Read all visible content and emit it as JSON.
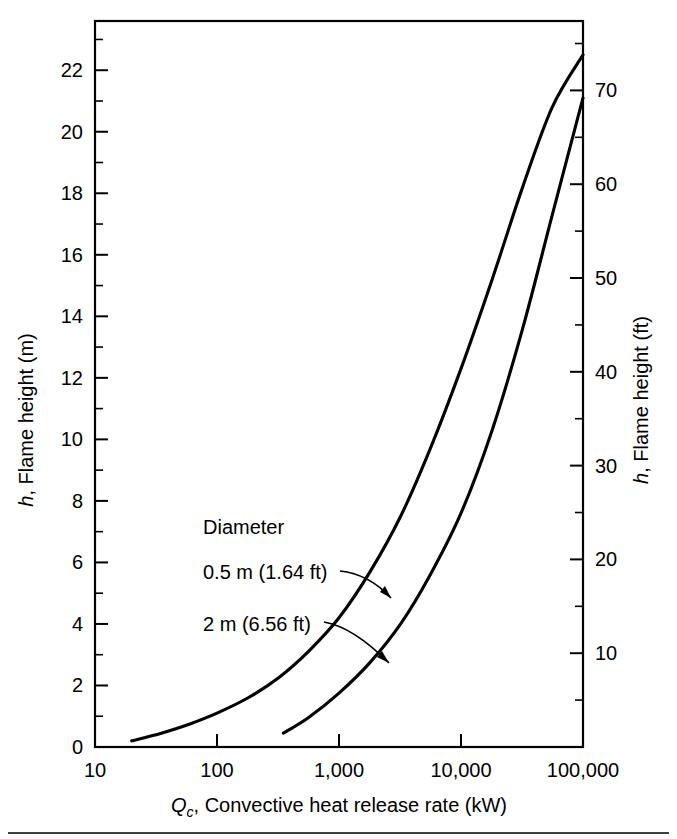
{
  "chart_data": {
    "type": "line",
    "title": "",
    "xlabel": "Qc, Convective heat release rate (kW)",
    "xlabel_main": ", Convective heat release rate (kW)",
    "xlabel_symbol": "Q",
    "xlabel_subscript": "c",
    "ylabel": "h, Flame height (m)",
    "ylabel_symbol": "h",
    "ylabel_rest": ", Flame height (m)",
    "ylabel_right": "h, Flame height (ft)",
    "ylabel_right_symbol": "h",
    "ylabel_right_rest": ", Flame height (ft)",
    "xscale": "log",
    "xlim": [
      10,
      100000
    ],
    "ylim": [
      0,
      23.6
    ],
    "ylim_right_ft": [
      0,
      77.4
    ],
    "grid": false,
    "legend_position": "inside-left",
    "x_tick_labels": [
      "10",
      "100",
      "1,000",
      "10,000",
      "100,000"
    ],
    "x_tick_values": [
      10,
      100,
      1000,
      10000,
      100000
    ],
    "y_tick_labels": [
      "0",
      "2",
      "4",
      "6",
      "8",
      "10",
      "12",
      "14",
      "16",
      "18",
      "20",
      "22"
    ],
    "y_tick_values": [
      0,
      2,
      4,
      6,
      8,
      10,
      12,
      14,
      16,
      18,
      20,
      22
    ],
    "y_right_tick_labels": [
      "10",
      "20",
      "30",
      "40",
      "50",
      "60",
      "70"
    ],
    "y_right_tick_values": [
      10,
      20,
      30,
      40,
      50,
      60,
      70
    ],
    "annotations": {
      "group_label": "Diameter",
      "series1_label": "0.5 m (1.64 ft)",
      "series2_label": "2 m (6.56 ft)"
    },
    "series": [
      {
        "name": "0.5 m (1.64 ft)",
        "x": [
          20,
          35,
          60,
          100,
          180,
          320,
          560,
          1000,
          1800,
          3200,
          5600,
          10000,
          18000,
          32000,
          56000,
          100000
        ],
        "y": [
          0.2,
          0.45,
          0.75,
          1.1,
          1.6,
          2.25,
          3.1,
          4.2,
          5.7,
          7.5,
          9.7,
          12.3,
          15.2,
          18.2,
          20.8,
          22.5
        ]
      },
      {
        "name": "2 m (6.56 ft)",
        "x": [
          350,
          560,
          1000,
          1800,
          3200,
          5600,
          10000,
          18000,
          32000,
          56000,
          100000
        ],
        "y": [
          0.45,
          0.95,
          1.75,
          2.75,
          4.0,
          5.6,
          7.6,
          10.3,
          13.6,
          17.3,
          21.1
        ]
      }
    ]
  },
  "geometry": {
    "plot_left": 95,
    "plot_right": 583,
    "plot_top": 21,
    "plot_bottom": 747,
    "y_unit_px": 30.3,
    "decade_px": 122
  }
}
